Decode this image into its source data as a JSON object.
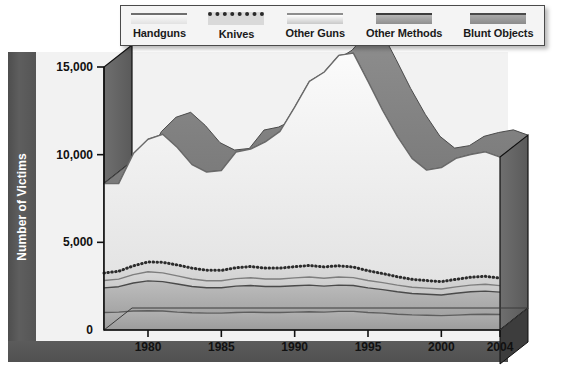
{
  "legend": {
    "items": [
      {
        "label": "Handguns",
        "swatch": "handguns-swatch",
        "color": "#e8e8e8"
      },
      {
        "label": "Knives",
        "swatch": "knives-swatch",
        "color": "#2a2a2a"
      },
      {
        "label": "Other Guns",
        "swatch": "other-guns-swatch",
        "color": "#d2d2d2"
      },
      {
        "label": "Other Methods",
        "swatch": "other-methods-swatch",
        "color": "#9a9a9a"
      },
      {
        "label": "Blunt Objects",
        "swatch": "blunt-objects-swatch",
        "color": "#9e9e9e"
      }
    ]
  },
  "axis": {
    "y_title": "Number of Victims",
    "y_ticks": [
      "0",
      "5,000",
      "10,000",
      "15,000"
    ],
    "x_ticks": [
      "1980",
      "1985",
      "1990",
      "1995",
      "2000",
      "2004"
    ]
  },
  "chart_data": {
    "type": "area",
    "title": "",
    "xlabel": "",
    "ylabel": "Number of Victims",
    "ylim": [
      0,
      15000
    ],
    "grid": false,
    "legend_position": "top",
    "stacked": true,
    "x": [
      1977,
      1978,
      1979,
      1980,
      1981,
      1982,
      1983,
      1984,
      1985,
      1986,
      1987,
      1988,
      1989,
      1990,
      1991,
      1992,
      1993,
      1994,
      1995,
      1996,
      1997,
      1998,
      1999,
      2000,
      2001,
      2002,
      2003,
      2004
    ],
    "series": [
      {
        "name": "Blunt Objects",
        "values": [
          1000,
          1020,
          1080,
          1100,
          1080,
          1020,
          980,
          960,
          960,
          1000,
          1020,
          1000,
          1000,
          1020,
          1040,
          1020,
          1060,
          1060,
          1000,
          960,
          900,
          860,
          840,
          820,
          850,
          880,
          900,
          880
        ]
      },
      {
        "name": "Other Methods",
        "values": [
          1400,
          1450,
          1600,
          1700,
          1680,
          1600,
          1500,
          1450,
          1450,
          1500,
          1520,
          1480,
          1480,
          1500,
          1520,
          1480,
          1500,
          1480,
          1400,
          1340,
          1280,
          1220,
          1200,
          1180,
          1250,
          1300,
          1320,
          1280
        ]
      },
      {
        "name": "Other Guns",
        "values": [
          420,
          430,
          480,
          520,
          500,
          470,
          430,
          400,
          400,
          430,
          440,
          430,
          430,
          450,
          460,
          450,
          460,
          450,
          420,
          400,
          380,
          360,
          350,
          340,
          360,
          380,
          390,
          370
        ]
      },
      {
        "name": "Knives",
        "values": [
          430,
          450,
          500,
          560,
          600,
          620,
          620,
          600,
          590,
          620,
          640,
          620,
          620,
          640,
          660,
          650,
          640,
          600,
          560,
          520,
          480,
          450,
          430,
          420,
          430,
          450,
          450,
          430
        ]
      },
      {
        "name": "Handguns",
        "values": [
          5100,
          5000,
          6400,
          7000,
          7300,
          6700,
          5900,
          5600,
          5700,
          6600,
          6700,
          7200,
          7800,
          9100,
          10500,
          11100,
          12000,
          12200,
          10800,
          9300,
          8000,
          6900,
          6300,
          6500,
          6900,
          7000,
          7100,
          6900
        ]
      }
    ]
  }
}
